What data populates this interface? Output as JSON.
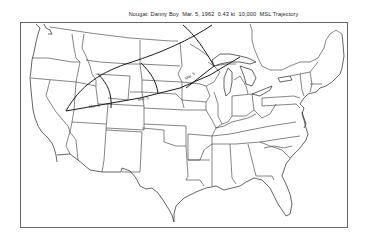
{
  "title": {
    "event": "Nougat: Danny Boy",
    "date": "Mar. 5, 1962",
    "yield": "0.43 kt",
    "altitude": "10,000",
    "suffix": "MSL Trajectory",
    "full": "Nougat: Danny Boy  Mar. 5, 1962  0.43 kt  10,000  MSL Trajectory"
  },
  "map": {
    "region": "Contiguous United States",
    "trajectory_labels": [
      {
        "id": "label-west",
        "text": "Mar. 5"
      },
      {
        "id": "label-central",
        "text": "Mar. 5"
      },
      {
        "id": "label-north",
        "text": "Mar. 5"
      }
    ],
    "colors": {
      "line": "#1a1a1a",
      "background": "#ffffff"
    }
  }
}
